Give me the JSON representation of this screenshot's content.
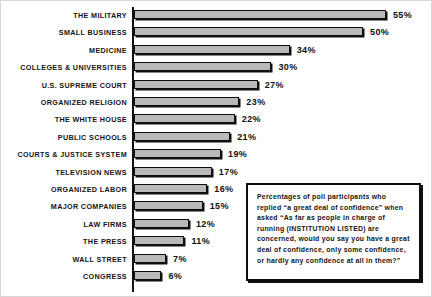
{
  "chart_data": {
    "type": "bar",
    "orientation": "horizontal",
    "title": "",
    "xlabel": "",
    "ylabel": "",
    "xlim": [
      0,
      60
    ],
    "grid": false,
    "legend": null,
    "categories": [
      "THE MILITARY",
      "SMALL BUSINESS",
      "MEDICINE",
      "COLLEGES & UNIVERSITIES",
      "U.S. SUPREME COURT",
      "ORGANIZED RELIGION",
      "THE WHITE HOUSE",
      "PUBLIC SCHOOLS",
      "COURTS & JUSTICE SYSTEM",
      "TELEVISION NEWS",
      "ORGANIZED LABOR",
      "MAJOR COMPANIES",
      "LAW FIRMS",
      "THE PRESS",
      "WALL STREET",
      "CONGRESS"
    ],
    "values": [
      55,
      50,
      34,
      30,
      27,
      23,
      22,
      21,
      19,
      17,
      16,
      15,
      12,
      11,
      7,
      6
    ],
    "value_labels": [
      "55%",
      "50%",
      "34%",
      "30%",
      "27%",
      "23%",
      "22%",
      "21%",
      "19%",
      "17%",
      "16%",
      "15%",
      "12%",
      "11%",
      "7%",
      "6%"
    ],
    "bar_fill_color": "#b9b9b9",
    "bar_edge_color": "#0d0d0d",
    "axis_color": "#111111"
  },
  "caption": {
    "text": "Percentages of poll participants who replied “a great deal of confidence” when asked “As far as people in charge of running (INSTITUTION LISTED) are concerned, would you say you have a great deal of confidence, only some confidence, or hardly any confidence at all in them?”"
  }
}
